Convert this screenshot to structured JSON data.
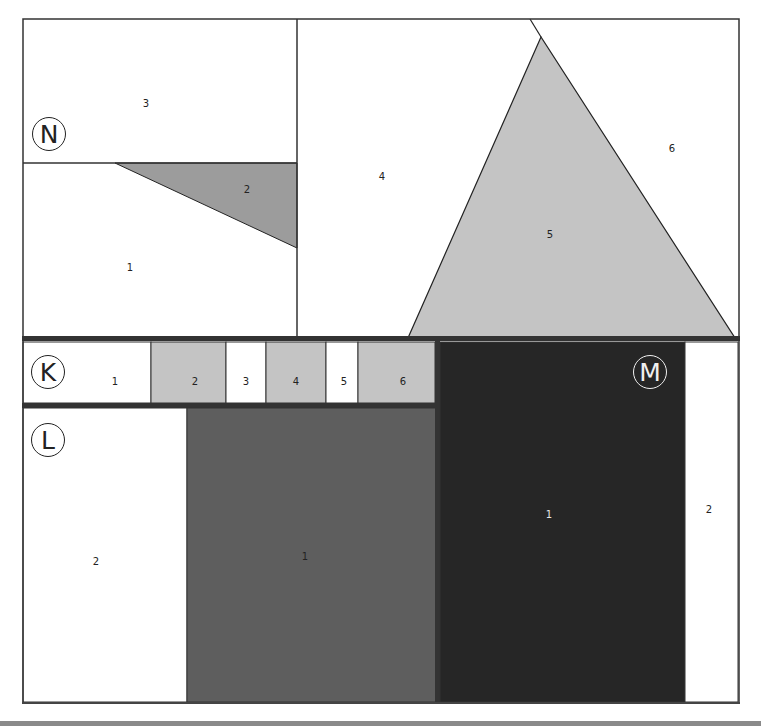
{
  "colors": {
    "frame": "#333333",
    "white": "#ffffff",
    "light_gray": "#c4c4c4",
    "mid_gray": "#9c9c9c",
    "dark_gray": "#5e5e5e",
    "near_black": "#262626",
    "bottom_bar": "#8a8a8a"
  },
  "sections": {
    "N": {
      "badge": "N",
      "regions": [
        {
          "id": "1",
          "label": "1"
        },
        {
          "id": "2",
          "label": "2"
        },
        {
          "id": "3",
          "label": "3"
        },
        {
          "id": "4",
          "label": "4"
        },
        {
          "id": "5",
          "label": "5"
        },
        {
          "id": "6",
          "label": "6"
        }
      ]
    },
    "K": {
      "badge": "K",
      "regions": [
        {
          "id": "1",
          "label": "1"
        },
        {
          "id": "2",
          "label": "2"
        },
        {
          "id": "3",
          "label": "3"
        },
        {
          "id": "4",
          "label": "4"
        },
        {
          "id": "5",
          "label": "5"
        },
        {
          "id": "6",
          "label": "6"
        }
      ]
    },
    "L": {
      "badge": "L",
      "regions": [
        {
          "id": "1",
          "label": "1"
        },
        {
          "id": "2",
          "label": "2"
        }
      ]
    },
    "M": {
      "badge": "M",
      "regions": [
        {
          "id": "1",
          "label": "1"
        },
        {
          "id": "2",
          "label": "2"
        }
      ]
    }
  }
}
